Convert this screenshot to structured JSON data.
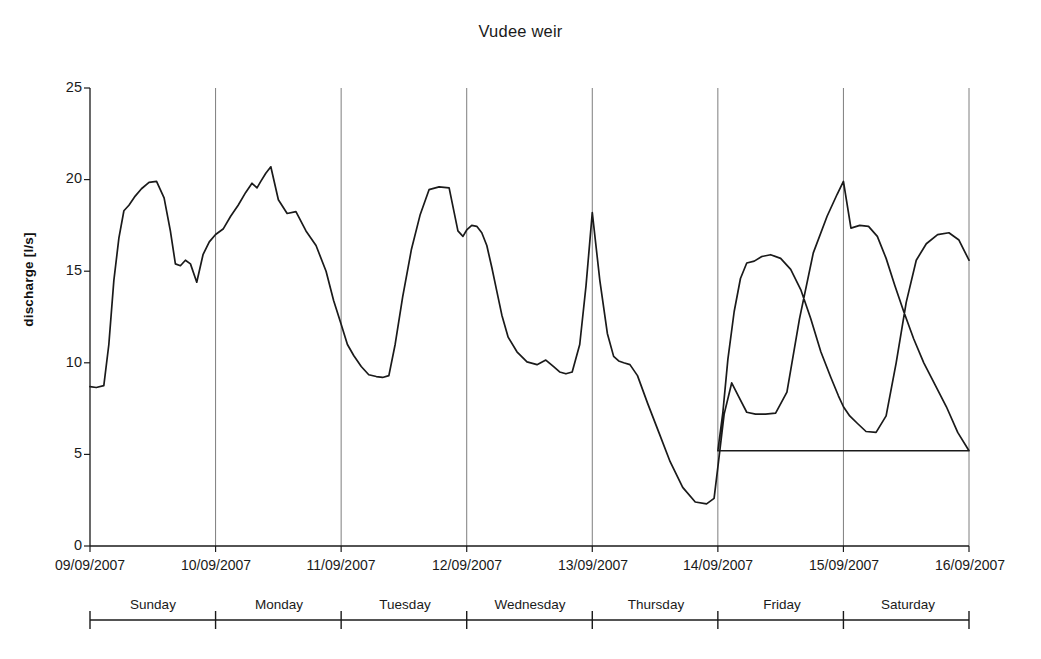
{
  "chart_data": {
    "type": "line",
    "title": "Vudee weir",
    "xlabel": "",
    "ylabel": "discharge [l/s]",
    "ylim": [
      0,
      25
    ],
    "ytick_values": [
      0,
      5,
      10,
      15,
      20,
      25
    ],
    "ytick_labels": [
      "0",
      "5",
      "10",
      "15",
      "20",
      "25"
    ],
    "xtick_labels": [
      "09/09/2007",
      "10/09/2007",
      "11/09/2007",
      "12/09/2007",
      "13/09/2007",
      "14/09/2007",
      "15/09/2007",
      "16/09/2007"
    ],
    "day_labels": [
      "Sunday",
      "Monday",
      "Tuesday",
      "Wednesday",
      "Thursday",
      "Friday",
      "Saturday"
    ],
    "grid": "vertical-day-boundaries",
    "legend": "none",
    "line_color": "#1a1a1a",
    "series": [
      {
        "name": "discharge",
        "units": "l/s",
        "x_units": "days since 09/09/2007 00:00",
        "x": [
          0.0,
          0.05,
          0.11,
          0.15,
          0.19,
          0.23,
          0.27,
          0.31,
          0.36,
          0.41,
          0.47,
          0.53,
          0.59,
          0.64,
          0.68,
          0.72,
          0.76,
          0.8,
          0.85,
          0.9,
          0.95,
          1.0,
          1.06,
          1.12,
          1.18,
          1.24,
          1.29,
          1.33,
          1.36,
          1.4,
          1.44,
          1.5,
          1.57,
          1.64,
          1.72,
          1.8,
          1.88,
          1.94,
          2.0,
          2.05,
          2.1,
          2.16,
          2.22,
          2.28,
          2.33,
          2.38,
          2.43,
          2.49,
          2.56,
          2.63,
          2.7,
          2.78,
          2.86,
          2.93,
          2.97,
          3.0,
          3.04,
          3.08,
          3.12,
          3.16,
          3.2,
          3.24,
          3.28,
          3.33,
          3.4,
          3.48,
          3.56,
          3.63,
          3.69,
          3.74,
          3.79,
          3.84,
          3.9,
          3.95,
          4.0,
          4.06,
          4.12,
          4.17,
          4.21,
          4.25,
          4.3,
          4.36,
          4.44,
          4.53,
          4.62,
          4.72,
          4.82,
          4.91,
          4.97,
          5.0,
          5.05,
          5.11,
          5.17,
          5.23,
          5.3,
          5.38,
          5.46,
          5.55,
          5.65,
          5.76,
          5.87,
          5.95,
          6.0,
          6.06,
          6.13,
          6.2,
          6.27,
          6.34,
          6.41,
          6.48,
          6.56,
          6.64,
          6.73,
          6.82,
          6.91,
          7.0
        ],
        "y": [
          8.7,
          8.65,
          8.75,
          11.0,
          14.5,
          16.8,
          18.3,
          18.6,
          19.1,
          19.5,
          19.85,
          19.9,
          19.0,
          17.2,
          15.4,
          15.3,
          15.6,
          15.4,
          14.4,
          15.9,
          16.6,
          17.0,
          17.3,
          18.0,
          18.6,
          19.3,
          19.8,
          19.55,
          19.9,
          20.35,
          20.7,
          18.9,
          18.15,
          18.25,
          17.2,
          16.4,
          15.0,
          13.4,
          12.1,
          11.0,
          10.4,
          9.8,
          9.35,
          9.25,
          9.2,
          9.3,
          11.0,
          13.6,
          16.2,
          18.1,
          19.45,
          19.6,
          19.55,
          17.2,
          16.9,
          17.25,
          17.5,
          17.45,
          17.1,
          16.4,
          15.2,
          13.9,
          12.6,
          11.4,
          10.6,
          10.05,
          9.9,
          10.15,
          9.8,
          9.5,
          9.4,
          9.5,
          11.0,
          14.2,
          18.2,
          14.5,
          11.6,
          10.35,
          10.1,
          10.0,
          9.9,
          9.3,
          7.8,
          6.2,
          4.6,
          3.2,
          2.4,
          2.3,
          2.6,
          4.3,
          7.2,
          8.9,
          8.1,
          7.3,
          7.2,
          7.2,
          7.25,
          8.4,
          12.4,
          16.0,
          18.0,
          19.2,
          19.9,
          17.35,
          17.5,
          17.45,
          16.9,
          15.7,
          14.2,
          12.8,
          11.3,
          10.0,
          8.8,
          7.6,
          6.2,
          5.2
        ]
      },
      {
        "name": "discharge_continued",
        "units": "l/s",
        "x_units": "days since 09/09/2007 00:00",
        "x": [
          5.0,
          5.04,
          5.08,
          5.13,
          5.18,
          5.23,
          5.29,
          5.35,
          5.42,
          5.5,
          5.58,
          5.66,
          5.74,
          5.82,
          5.9,
          5.96,
          6.0,
          6.05,
          6.11,
          6.18,
          6.26,
          6.34,
          6.42,
          6.5,
          6.58,
          6.66,
          6.75,
          6.84,
          6.92,
          7.0
        ],
        "y": [
          5.2,
          7.3,
          10.2,
          12.8,
          14.6,
          15.45,
          15.55,
          15.8,
          15.9,
          15.7,
          15.1,
          14.0,
          12.4,
          10.6,
          9.2,
          8.2,
          7.6,
          7.1,
          6.7,
          6.25,
          6.2,
          7.1,
          10.0,
          13.3,
          15.6,
          16.5,
          17.0,
          17.1,
          16.7,
          15.6
        ]
      }
    ]
  },
  "axes": {
    "plot_left_px": 90,
    "plot_right_px": 969,
    "plot_top_px": 88,
    "plot_bottom_px": 546
  }
}
